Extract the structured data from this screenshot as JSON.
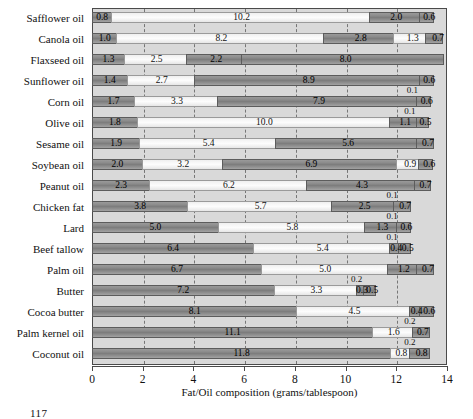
{
  "chart_data": {
    "type": "bar",
    "orientation": "horizontal",
    "stacked": true,
    "title": "",
    "xlabel": "Fat/Oil composition (grams/tablespoon)",
    "ylabel": "",
    "xlim": [
      0,
      14
    ],
    "xticks": [
      0,
      2,
      4,
      6,
      8,
      10,
      12,
      14
    ],
    "grid": "vertical-dashed",
    "legend": "none",
    "categories": [
      "Safflower oil",
      "Canola oil",
      "Flaxseed oil",
      "Sunflower oil",
      "Corn oil",
      "Olive oil",
      "Sesame oil",
      "Soybean oil",
      "Peanut oil",
      "Chicken fat",
      "Lard",
      "Beef tallow",
      "Palm oil",
      "Butter",
      "Cocoa butter",
      "Palm kernel oil",
      "Coconut oil"
    ],
    "series": [
      {
        "name": "segment-1",
        "style": "dark",
        "values": [
          0.8,
          1.0,
          1.3,
          1.4,
          1.7,
          1.8,
          1.9,
          2.0,
          2.3,
          3.8,
          5.0,
          6.4,
          6.7,
          7.2,
          8.1,
          11.1,
          11.8
        ]
      },
      {
        "name": "segment-2",
        "style": "light",
        "values": [
          10.2,
          8.2,
          2.5,
          2.7,
          3.3,
          10.0,
          5.4,
          3.2,
          6.2,
          5.7,
          5.8,
          5.4,
          5.0,
          3.3,
          4.5,
          1.6,
          0.8
        ]
      },
      {
        "name": "segment-3",
        "style": "dark",
        "values": [
          2.0,
          2.8,
          2.2,
          8.9,
          7.9,
          1.1,
          5.6,
          6.9,
          4.3,
          2.5,
          1.3,
          0.4,
          1.2,
          0.3,
          0.4,
          0.2,
          0.2
        ]
      },
      {
        "name": "segment-4",
        "style": "light",
        "values": [
          null,
          1.3,
          8.0,
          null,
          0.1,
          null,
          null,
          0.9,
          0.1,
          0.1,
          0.1,
          0.1,
          null,
          0.2,
          null,
          null,
          null
        ]
      },
      {
        "name": "segment-5",
        "style": "dark",
        "values": [
          0.6,
          0.7,
          null,
          0.6,
          0.6,
          0.5,
          0.7,
          0.6,
          0.7,
          0.7,
          0.6,
          0.5,
          0.7,
          0.5,
          0.6,
          0.7,
          0.8
        ]
      }
    ],
    "rows": [
      {
        "label": "Safflower oil",
        "segments": [
          {
            "v": 0.8,
            "style": "sat"
          },
          {
            "v": 10.2,
            "style": "mono"
          },
          {
            "v": 2.0,
            "style": "poly"
          },
          {
            "v": 0.6,
            "style": "other"
          }
        ],
        "above": null
      },
      {
        "label": "Canola oil",
        "segments": [
          {
            "v": 1.0,
            "style": "sat"
          },
          {
            "v": 8.2,
            "style": "mono"
          },
          {
            "v": 2.8,
            "style": "poly"
          },
          {
            "v": 1.3,
            "style": "mono"
          },
          {
            "v": 0.7,
            "style": "other"
          }
        ],
        "above": null
      },
      {
        "label": "Flaxseed oil",
        "segments": [
          {
            "v": 1.3,
            "style": "sat"
          },
          {
            "v": 2.5,
            "style": "mono"
          },
          {
            "v": 2.2,
            "style": "poly"
          },
          {
            "v": 8.0,
            "style": "poly"
          }
        ],
        "above": null
      },
      {
        "label": "Sunflower oil",
        "segments": [
          {
            "v": 1.4,
            "style": "sat"
          },
          {
            "v": 2.7,
            "style": "mono"
          },
          {
            "v": 8.9,
            "style": "poly"
          },
          {
            "v": 0.6,
            "style": "other"
          }
        ],
        "above": null
      },
      {
        "label": "Corn oil",
        "segments": [
          {
            "v": 1.7,
            "style": "sat"
          },
          {
            "v": 3.3,
            "style": "mono"
          },
          {
            "v": 7.9,
            "style": "poly"
          },
          {
            "v": 0.6,
            "style": "other"
          }
        ],
        "above": "0.1"
      },
      {
        "label": "Olive oil",
        "segments": [
          {
            "v": 1.8,
            "style": "sat"
          },
          {
            "v": 10.0,
            "style": "mono"
          },
          {
            "v": 1.1,
            "style": "poly"
          },
          {
            "v": 0.5,
            "style": "other"
          }
        ],
        "above": "0.1"
      },
      {
        "label": "Sesame oil",
        "segments": [
          {
            "v": 1.9,
            "style": "sat"
          },
          {
            "v": 5.4,
            "style": "mono"
          },
          {
            "v": 5.6,
            "style": "poly"
          },
          {
            "v": 0.7,
            "style": "other"
          }
        ],
        "above": null
      },
      {
        "label": "Soybean oil",
        "segments": [
          {
            "v": 2.0,
            "style": "sat"
          },
          {
            "v": 3.2,
            "style": "mono"
          },
          {
            "v": 6.9,
            "style": "poly"
          },
          {
            "v": 0.9,
            "style": "mono"
          },
          {
            "v": 0.6,
            "style": "other"
          }
        ],
        "above": null
      },
      {
        "label": "Peanut oil",
        "segments": [
          {
            "v": 2.3,
            "style": "sat"
          },
          {
            "v": 6.2,
            "style": "mono"
          },
          {
            "v": 4.3,
            "style": "poly"
          },
          {
            "v": 0.7,
            "style": "other"
          }
        ],
        "above": null
      },
      {
        "label": "Chicken fat",
        "segments": [
          {
            "v": 3.8,
            "style": "sat"
          },
          {
            "v": 5.7,
            "style": "mono"
          },
          {
            "v": 2.5,
            "style": "poly"
          },
          {
            "v": 0.7,
            "style": "other"
          }
        ],
        "above": "0.1"
      },
      {
        "label": "Lard",
        "segments": [
          {
            "v": 5.0,
            "style": "sat"
          },
          {
            "v": 5.8,
            "style": "mono"
          },
          {
            "v": 1.3,
            "style": "poly"
          },
          {
            "v": 0.6,
            "style": "other"
          }
        ],
        "above": "0.1"
      },
      {
        "label": "Beef tallow",
        "segments": [
          {
            "v": 6.4,
            "style": "sat"
          },
          {
            "v": 5.4,
            "style": "mono"
          },
          {
            "v": 0.4,
            "style": "poly"
          },
          {
            "v": 0.5,
            "style": "other"
          }
        ],
        "above": "0.1"
      },
      {
        "label": "Palm oil",
        "segments": [
          {
            "v": 6.7,
            "style": "sat"
          },
          {
            "v": 5.0,
            "style": "mono"
          },
          {
            "v": 1.2,
            "style": "poly"
          },
          {
            "v": 0.7,
            "style": "other"
          }
        ],
        "above": null
      },
      {
        "label": "Butter",
        "segments": [
          {
            "v": 7.2,
            "style": "sat"
          },
          {
            "v": 3.3,
            "style": "mono"
          },
          {
            "v": 0.3,
            "style": "poly"
          },
          {
            "v": 0.5,
            "style": "other"
          }
        ],
        "above": "0.2"
      },
      {
        "label": "Cocoa butter",
        "segments": [
          {
            "v": 8.1,
            "style": "sat"
          },
          {
            "v": 4.5,
            "style": "mono"
          },
          {
            "v": 0.4,
            "style": "poly"
          },
          {
            "v": 0.6,
            "style": "other"
          }
        ],
        "above": null
      },
      {
        "label": "Palm kernel oil",
        "segments": [
          {
            "v": 11.1,
            "style": "sat"
          },
          {
            "v": 1.6,
            "style": "mono"
          },
          {
            "v": 0.7,
            "style": "other"
          }
        ],
        "above": "0.2"
      },
      {
        "label": "Coconut oil",
        "segments": [
          {
            "v": 11.8,
            "style": "sat"
          },
          {
            "v": 0.8,
            "style": "mono"
          },
          {
            "v": 0.8,
            "style": "other"
          }
        ],
        "above": "0.2"
      }
    ]
  },
  "footer": {
    "page_number": "117"
  }
}
